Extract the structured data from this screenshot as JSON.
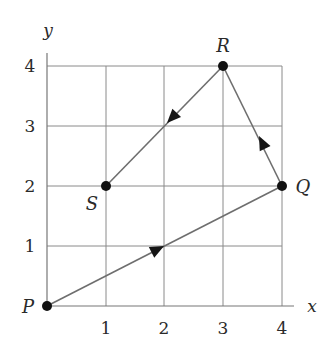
{
  "figure": {
    "axes": {
      "x_label": "x",
      "y_label": "y"
    },
    "x_ticks": [
      "1",
      "2",
      "3",
      "4"
    ],
    "y_ticks": [
      "1",
      "2",
      "3",
      "4"
    ],
    "points": [
      {
        "name": "P",
        "x": 0,
        "y": 0
      },
      {
        "name": "Q",
        "x": 4,
        "y": 2
      },
      {
        "name": "R",
        "x": 3,
        "y": 4
      },
      {
        "name": "S",
        "x": 1,
        "y": 2
      }
    ],
    "path": [
      {
        "from": "P",
        "to": "Q"
      },
      {
        "from": "Q",
        "to": "R"
      },
      {
        "from": "R",
        "to": "S"
      }
    ],
    "colors": {
      "grid": "#8a8a8a",
      "path": "#6e6e6e",
      "point": "#111111"
    }
  }
}
